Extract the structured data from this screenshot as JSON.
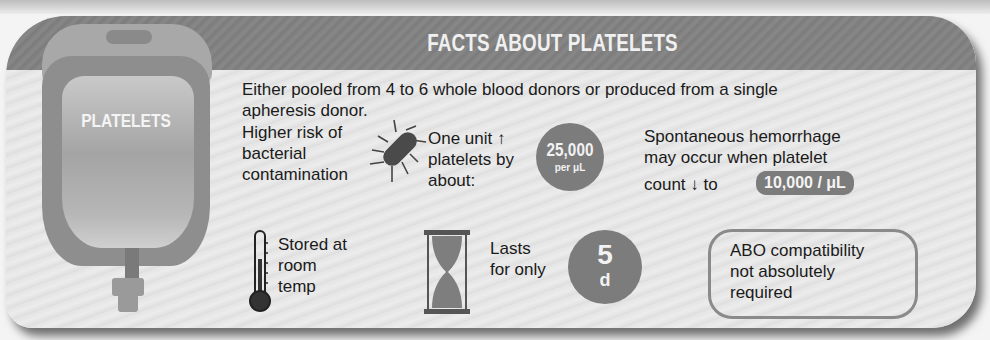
{
  "title": "FACTS ABOUT PLATELETS",
  "bag_label": "PLATELETS",
  "intro": {
    "line1": "Either pooled from 4 to 6 whole blood donors or produced from a single",
    "line2": "apheresis donor."
  },
  "bacterial": {
    "lines": [
      "Higher risk of",
      "bacterial",
      "contamination"
    ],
    "icon": "bacterium-icon"
  },
  "unit_increase": {
    "lines": [
      "One unit ↑",
      "platelets by",
      "about:"
    ],
    "value": "25,000",
    "unit": "per μL"
  },
  "hemorrhage": {
    "lines": [
      "Spontaneous hemorrhage",
      "may occur when platelet"
    ],
    "line3_prefix": "count ↓ to",
    "threshold": "10,000 / μL"
  },
  "storage": {
    "lines": [
      "Stored at",
      "room",
      "temp"
    ],
    "icon": "thermometer-icon"
  },
  "shelf_life": {
    "lines": [
      "Lasts",
      "for only"
    ],
    "value": "5",
    "unit": "d",
    "icon": "hourglass-icon"
  },
  "abo": {
    "lines": [
      "ABO compatibility",
      "not absolutely",
      "required"
    ]
  },
  "colors": {
    "header": "#808080",
    "accent_circle": "#7c7c7c",
    "background": "#e6e6e6"
  }
}
